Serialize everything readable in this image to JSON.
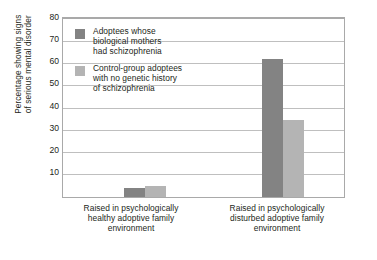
{
  "chart_data": {
    "type": "bar",
    "title": "",
    "subtitle": "",
    "xlabel": "",
    "ylabel": "Percentage showing signs of serious mental disorder",
    "ylim": [
      0,
      80
    ],
    "yticks": [
      10,
      20,
      30,
      40,
      50,
      60,
      70,
      80
    ],
    "grid": true,
    "legend_position": "inside-top-left",
    "categories": [
      "Raised in psychologically healthy adoptive family environment",
      "Raised in psychologically disturbed adoptive family environment"
    ],
    "series": [
      {
        "name": "Adoptees whose biological mothers had schizophrenia",
        "color": "#838383",
        "values": [
          4,
          63
        ]
      },
      {
        "name": "Control-group adoptees with no genetic history of schizophrenia",
        "color": "#b4b4b4",
        "values": [
          5,
          35
        ]
      }
    ]
  },
  "axis": {
    "y_title_line1": "Percentage showing signs",
    "y_title_line2": "of serious mental disorder",
    "ticks": [
      "80",
      "70",
      "60",
      "50",
      "40",
      "30",
      "20",
      "10"
    ]
  },
  "legend": {
    "items": [
      {
        "swatch": "dark",
        "line1": "Adoptees whose",
        "line2": "biological mothers",
        "line3": "had schizophrenia"
      },
      {
        "swatch": "light",
        "line1": "Control-group adoptees",
        "line2": "with no genetic history",
        "line3": "of schizophrenia"
      }
    ]
  },
  "x_axis": {
    "group0": {
      "line1": "Raised in psychologically",
      "line2": "healthy adoptive family",
      "line3": "environment"
    },
    "group1": {
      "line1": "Raised in psychologically",
      "line2": "disturbed adoptive family",
      "line3": "environment"
    }
  }
}
